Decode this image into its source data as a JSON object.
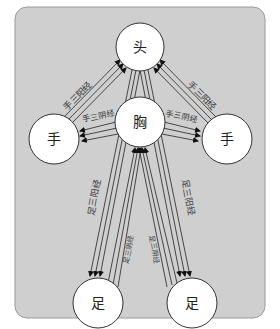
{
  "diagram": {
    "type": "meridian-flow",
    "colors": {
      "panel": "#cfcfcf",
      "panel_border": "#9a9a9a",
      "node_fill": "#ffffff",
      "line": "#222222"
    },
    "nodes": {
      "head": {
        "label": "头"
      },
      "chest": {
        "label": "胸"
      },
      "left_hand": {
        "label": "手"
      },
      "right_hand": {
        "label": "手"
      },
      "left_foot": {
        "label": "足"
      },
      "right_foot": {
        "label": "足"
      }
    },
    "edges": {
      "left_hand_to_head": {
        "label": "手三阳经",
        "from": "手",
        "to": "头"
      },
      "right_hand_to_head": {
        "label": "手三阳经",
        "from": "手",
        "to": "头"
      },
      "chest_to_left_hand": {
        "label": "手三阴经",
        "from": "胸",
        "to": "手"
      },
      "chest_to_right_hand": {
        "label": "手三阴经",
        "from": "胸",
        "to": "手"
      },
      "head_to_left_foot": {
        "label": "足三阳经",
        "from": "头",
        "to": "足"
      },
      "head_to_right_foot": {
        "label": "足三阳经",
        "from": "头",
        "to": "足"
      },
      "left_foot_to_chest": {
        "label": "足三阴经",
        "from": "足",
        "to": "胸"
      },
      "right_foot_to_chest": {
        "label": "足三阴经",
        "from": "足",
        "to": "胸"
      }
    }
  }
}
